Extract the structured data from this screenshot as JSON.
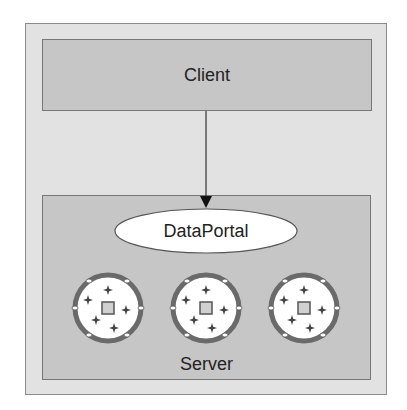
{
  "diagram": {
    "client": {
      "label": "Client"
    },
    "server": {
      "label": "Server"
    },
    "portal": {
      "label": "DataPortal"
    },
    "objects": [
      {
        "icon": "business-object-icon",
        "cx": 108,
        "cy": 308
      },
      {
        "icon": "business-object-icon",
        "cx": 206,
        "cy": 308
      },
      {
        "icon": "business-object-icon",
        "cx": 304,
        "cy": 308
      }
    ],
    "connector": {
      "from": "client",
      "to": "portal",
      "type": "arrow"
    }
  }
}
